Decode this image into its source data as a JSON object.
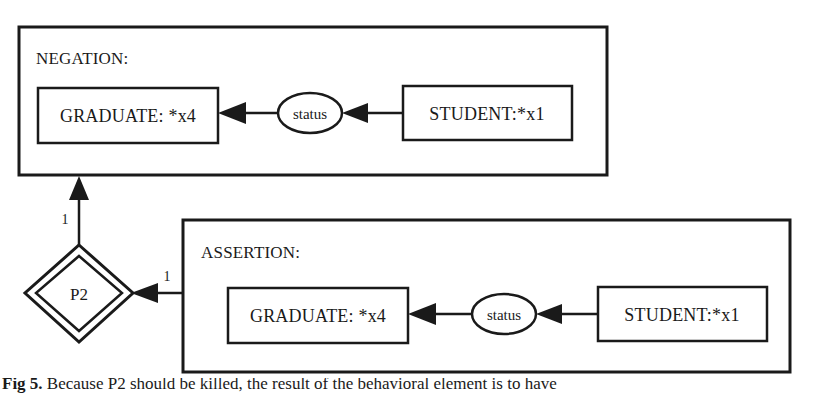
{
  "figure": {
    "kind": "conceptual-graph",
    "caption_label": "Fig 5.",
    "caption_rest": "Because P2 should be killed, the result of the behavioral element is to have",
    "ink_color": "#1a1a1a",
    "background_color": "#ffffff"
  },
  "negation_context": {
    "label": "NEGATION:",
    "concept_left": "GRADUATE: *x4",
    "relation": "status",
    "concept_right": "STUDENT:*x1"
  },
  "assertion_context": {
    "label": "ASSERTION:",
    "concept_left": "GRADUATE: *x4",
    "relation": "status",
    "concept_right": "STUDENT:*x1"
  },
  "proposition_node": {
    "label": "P2",
    "shape": "double-diamond"
  },
  "arcs": [
    {
      "id": "arc-p2-to-negation",
      "label": "1",
      "from": "proposition_node",
      "to": "negation_context",
      "direction": "up"
    },
    {
      "id": "arc-assertion-to-p2",
      "label": "1",
      "from": "assertion_context",
      "to": "proposition_node",
      "direction": "left"
    },
    {
      "id": "arc-neg-student-to-status",
      "label": "",
      "from": "negation_context.concept_right",
      "to": "negation_context.relation",
      "direction": "left"
    },
    {
      "id": "arc-neg-status-to-graduate",
      "label": "",
      "from": "negation_context.relation",
      "to": "negation_context.concept_left",
      "direction": "left"
    },
    {
      "id": "arc-asrt-student-to-status",
      "label": "",
      "from": "assertion_context.concept_right",
      "to": "assertion_context.relation",
      "direction": "left"
    },
    {
      "id": "arc-asrt-status-to-graduate",
      "label": "",
      "from": "assertion_context.relation",
      "to": "assertion_context.concept_left",
      "direction": "left"
    }
  ]
}
